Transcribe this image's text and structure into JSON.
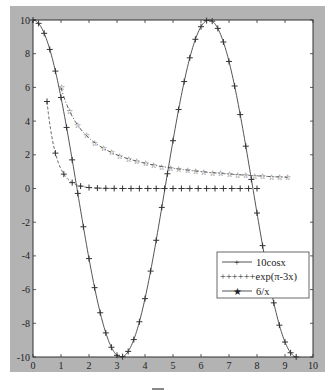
{
  "chart_data": {
    "type": "line",
    "title": "",
    "xlabel": "",
    "ylabel": "",
    "xlim": [
      0,
      10
    ],
    "ylim": [
      -10,
      10
    ],
    "grid": false,
    "xticks": [
      0,
      1,
      2,
      3,
      4,
      5,
      6,
      7,
      8,
      9,
      10
    ],
    "yticks": [
      -10,
      -8,
      -6,
      -4,
      -2,
      0,
      2,
      4,
      6,
      8,
      10
    ],
    "legend_position": "lower right (inside)",
    "series": [
      {
        "name": "10cosx",
        "function": "10*cos(x)",
        "x_range": [
          0,
          9.4
        ],
        "marker": "+",
        "marker_step": 0.2,
        "line_style": "solid",
        "color": "#555555"
      },
      {
        "name": "exp(π-3x)",
        "function": "exp(pi-3*x)",
        "x_range": [
          0.5,
          8.0
        ],
        "marker": "+",
        "marker_step": 0.3,
        "line_style": "dashed",
        "color": "#666666"
      },
      {
        "name": "6/x",
        "function": "6/x",
        "x_range": [
          1.0,
          9.1
        ],
        "marker": "star",
        "marker_step": 0.3,
        "line_style": "dash-dot",
        "color": "#555555"
      }
    ],
    "sample_points": {
      "10cosx": [
        [
          0,
          10
        ],
        [
          1,
          5.4
        ],
        [
          2,
          -4.16
        ],
        [
          3,
          -9.9
        ],
        [
          3.14,
          -10
        ],
        [
          4,
          -6.54
        ],
        [
          5,
          2.84
        ],
        [
          6,
          9.6
        ],
        [
          6.28,
          10
        ],
        [
          7,
          7.54
        ],
        [
          8,
          -1.46
        ],
        [
          9,
          -9.11
        ],
        [
          9.4,
          -10
        ]
      ],
      "exp(π-3x)": [
        [
          0.5,
          5.16
        ],
        [
          1,
          1.15
        ],
        [
          1.5,
          0.26
        ],
        [
          2,
          0.06
        ],
        [
          3,
          0
        ],
        [
          5,
          0
        ],
        [
          8,
          0
        ]
      ],
      "6/x": [
        [
          1,
          6
        ],
        [
          1.5,
          4
        ],
        [
          2,
          3
        ],
        [
          3,
          2
        ],
        [
          4,
          1.5
        ],
        [
          5,
          1.2
        ],
        [
          6,
          1
        ],
        [
          7,
          0.86
        ],
        [
          8,
          0.75
        ],
        [
          9,
          0.67
        ]
      ]
    }
  },
  "legend": {
    "items": [
      {
        "label": "10cosx"
      },
      {
        "label": "++++++exp(π-3x)"
      },
      {
        "label": "6/x"
      }
    ]
  },
  "caption": "—"
}
